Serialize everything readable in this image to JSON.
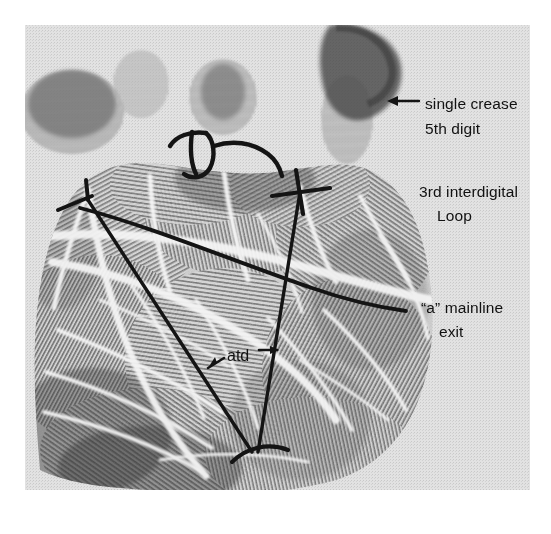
{
  "figure": {
    "kind": "palm-print-photograph",
    "background_color": "#ffffff",
    "print_tone": "#d8d8d8",
    "ink_color": "#1a1a1a",
    "plate_bounds": {
      "x": 25,
      "y": 25,
      "width": 505,
      "height": 465
    }
  },
  "annotations": {
    "single_crease": {
      "line1": "single crease",
      "line2": "5th digit",
      "arrow": "left-arrow-icon",
      "arrow_points_to": "5th digit single flexion crease"
    },
    "interdigital": {
      "line1": "3rd interdigital",
      "line2": "Loop"
    },
    "mainline": {
      "line1": "“a” mainline",
      "line2": "exit"
    },
    "atd": {
      "label": "atd",
      "arrow_left": "left-arrow-icon",
      "arrow_right": "right-arrow-icon",
      "meaning": "atd angle between triradii a, t and d"
    }
  },
  "ink_markings": {
    "triradius_a": {
      "x": 85,
      "y": 196,
      "label": "a"
    },
    "triradius_d": {
      "x": 301,
      "y": 190,
      "label": "d"
    },
    "triradius_t": {
      "x": 256,
      "y": 446,
      "label": "t"
    },
    "mainline_a_exit": {
      "x": 406,
      "y": 311
    },
    "interdigital_loop_center": {
      "x": 218,
      "y": 152
    }
  },
  "colors": {
    "paper": "#ffffff",
    "halftone": "#d9d9d9",
    "ink": "#141414",
    "ridge_dark": "#4a4a4a",
    "crease_light": "#f0f0f0"
  }
}
